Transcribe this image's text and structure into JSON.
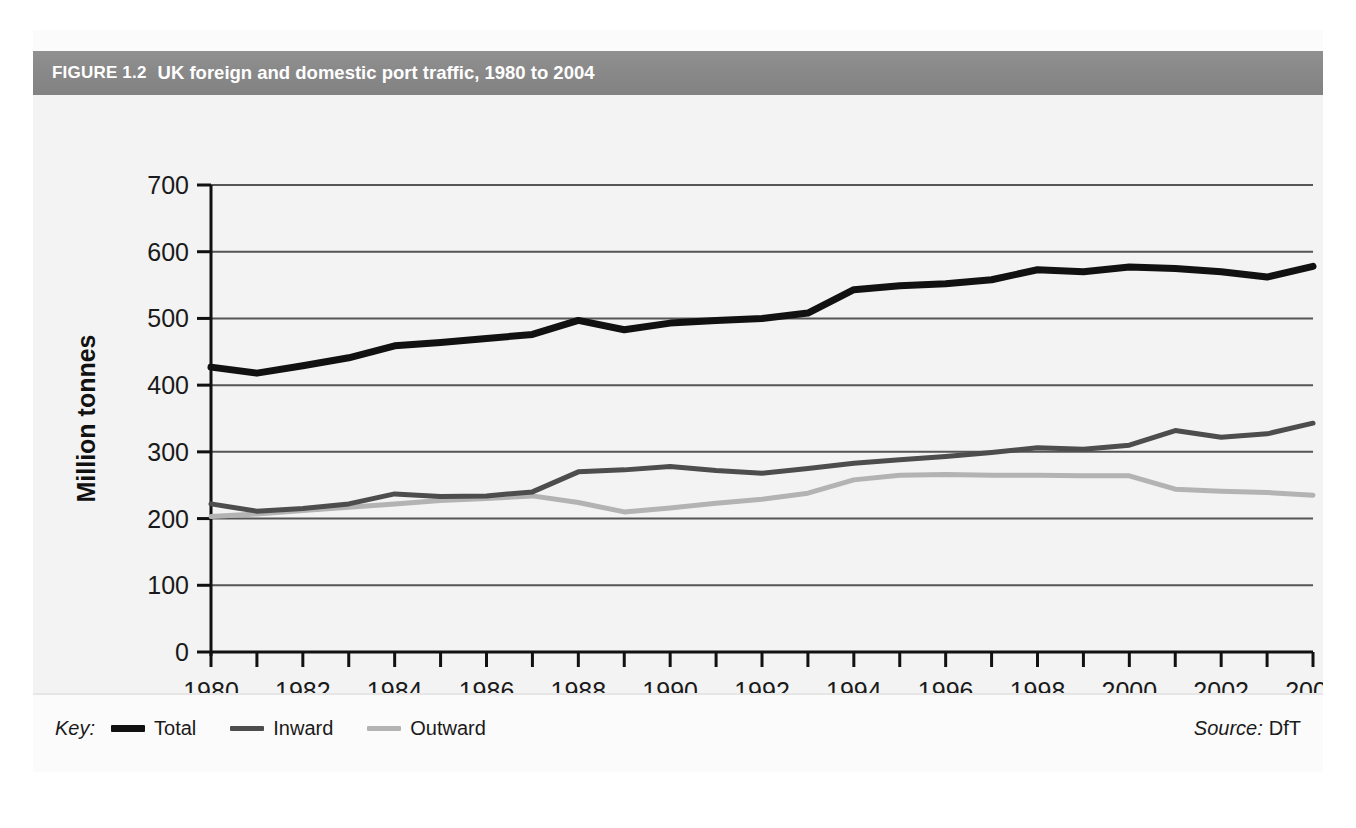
{
  "figure": {
    "number": "FIGURE 1.2",
    "title": "UK foreign and domestic port traffic, 1980 to 2004",
    "key_label": "Key:",
    "source_label": "Source:",
    "source_value": "DfT"
  },
  "colors": {
    "header_band": "#8a8a8a",
    "header_text": "#ffffff",
    "plot_background": "#f3f3f3",
    "gridline": "#555555",
    "axis": "#111111",
    "total": "#111111",
    "inward": "#4d4d4d",
    "outward": "#b3b3b3"
  },
  "chart_data": {
    "type": "line",
    "title": "UK foreign and domestic port traffic, 1980 to 2004",
    "xlabel": "",
    "ylabel": "Million tonnes",
    "xlim": [
      1980,
      2004
    ],
    "ylim": [
      0,
      700
    ],
    "ytick_step": 100,
    "xtick_step": 1,
    "xtick_label_step": 2,
    "grid": true,
    "legend_position": "bottom-left",
    "source": "DfT",
    "yticks": [
      0,
      100,
      200,
      300,
      400,
      500,
      600,
      700
    ],
    "x": [
      1980,
      1981,
      1982,
      1983,
      1984,
      1985,
      1986,
      1987,
      1988,
      1989,
      1990,
      1991,
      1992,
      1993,
      1994,
      1995,
      1996,
      1997,
      1998,
      1999,
      2000,
      2001,
      2002,
      2003,
      2004
    ],
    "xtick_labels": [
      "1980",
      "1982",
      "1984",
      "1986",
      "1988",
      "1990",
      "1992",
      "1994",
      "1996",
      "1998",
      "2000",
      "2002",
      "2004"
    ],
    "series": [
      {
        "name": "Total",
        "color": "#111111",
        "width": 7,
        "values": [
          427,
          418,
          429,
          441,
          459,
          464,
          470,
          476,
          497,
          483,
          493,
          497,
          500,
          508,
          543,
          549,
          552,
          558,
          573,
          570,
          577,
          575,
          570,
          562,
          578
        ]
      },
      {
        "name": "Inward",
        "color": "#4d4d4d",
        "width": 5,
        "values": [
          222,
          211,
          215,
          222,
          237,
          233,
          234,
          240,
          270,
          273,
          278,
          272,
          268,
          275,
          283,
          288,
          293,
          299,
          306,
          304,
          310,
          332,
          322,
          327,
          343
        ]
      },
      {
        "name": "Outward",
        "color": "#b3b3b3",
        "width": 5,
        "values": [
          203,
          207,
          212,
          217,
          222,
          227,
          230,
          234,
          224,
          210,
          216,
          223,
          229,
          238,
          258,
          265,
          266,
          265,
          265,
          264,
          264,
          244,
          241,
          239,
          235
        ]
      }
    ]
  }
}
